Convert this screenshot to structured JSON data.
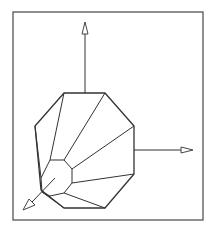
{
  "diagram": {
    "type": "3d-wireframe",
    "colors": {
      "background": "#ffffff",
      "frame": "#555555",
      "edges": "#333333",
      "arrowhead_fill": "#ffffff"
    },
    "frame": {
      "x": 13,
      "y": 12,
      "width": 190,
      "height": 208
    },
    "outer_octagon": [
      [
        64,
        93
      ],
      [
        105,
        93
      ],
      [
        134,
        126
      ],
      [
        134,
        174
      ],
      [
        105,
        208
      ],
      [
        64,
        208
      ],
      [
        41,
        190
      ],
      [
        35,
        126
      ]
    ],
    "inner_octagon": [
      [
        50,
        160
      ],
      [
        64,
        160
      ],
      [
        72,
        169
      ],
      [
        72,
        183
      ],
      [
        64,
        193
      ],
      [
        50,
        196
      ],
      [
        42,
        192
      ],
      [
        41,
        178
      ]
    ],
    "spokes": [
      [
        [
          50,
          160
        ],
        [
          64,
          93
        ]
      ],
      [
        [
          64,
          160
        ],
        [
          105,
          93
        ]
      ],
      [
        [
          72,
          169
        ],
        [
          134,
          126
        ]
      ],
      [
        [
          72,
          183
        ],
        [
          134,
          174
        ]
      ],
      [
        [
          64,
          193
        ],
        [
          105,
          208
        ]
      ],
      [
        [
          42,
          192
        ],
        [
          64,
          208
        ]
      ],
      [
        [
          41,
          178
        ],
        [
          35,
          126
        ]
      ]
    ],
    "axes": [
      {
        "name": "z-axis-up",
        "from": [
          85,
          93
        ],
        "to": [
          85,
          34
        ],
        "tip": [
          85,
          22
        ]
      },
      {
        "name": "x-axis-right",
        "from": [
          134,
          150
        ],
        "to": [
          181,
          150
        ],
        "tip": [
          193,
          150
        ]
      },
      {
        "name": "y-axis-diagonal",
        "from": [
          55,
          178
        ],
        "to": [
          33,
          202
        ],
        "tip": [
          23,
          210
        ]
      }
    ]
  }
}
